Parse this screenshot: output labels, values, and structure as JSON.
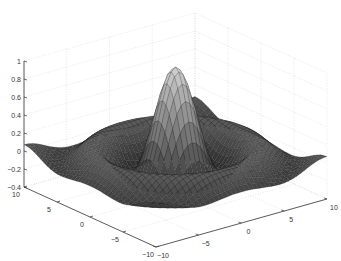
{
  "chart_data": {
    "type": "surface3d",
    "title": "",
    "function": "z = sin(r)/r, r = sqrt(x^2 + y^2)",
    "xlabel": "",
    "ylabel": "",
    "zlabel": "",
    "x_range": [
      -10,
      10
    ],
    "y_range": [
      -10,
      10
    ],
    "zlim": [
      -0.4,
      1
    ],
    "x_ticks": [
      "-10",
      "-5",
      "0",
      "5",
      "10"
    ],
    "y_ticks": [
      "10",
      "5",
      "0",
      "-5",
      "-10"
    ],
    "z_ticks": [
      "1",
      "0.8",
      "0.6",
      "0.4",
      "0.2",
      "0",
      "-0.2",
      "-0.4"
    ],
    "grid": true,
    "colormap": "gray",
    "peak": {
      "x": 0,
      "y": 0,
      "z": 1
    },
    "view": "default 3D (az -37.5, el 30)"
  },
  "axes": {
    "z_ticks": [
      "1",
      "0.8",
      "0.6",
      "0.4",
      "0.2",
      "0",
      "-0.2",
      "-0.4"
    ],
    "left_ticks": [
      "10",
      "5",
      "0",
      "-5",
      "-10"
    ],
    "right_ticks": [
      "-10",
      "-5",
      "0",
      "5",
      "10"
    ]
  },
  "colors": {
    "axis": "#333333",
    "grid": "#d8d8d8",
    "surface_dark": "#2a2a2a",
    "surface_light": "#c8c8c8"
  }
}
